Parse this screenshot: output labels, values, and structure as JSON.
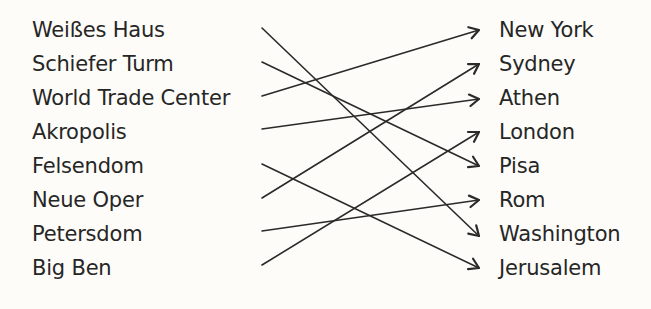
{
  "exercise": {
    "left_items": [
      {
        "label": "Weißes Haus",
        "y": 30
      },
      {
        "label": "Schiefer Turm",
        "y": 64
      },
      {
        "label": "World Trade Center",
        "y": 98
      },
      {
        "label": "Akropolis",
        "y": 132
      },
      {
        "label": "Felsendom",
        "y": 166
      },
      {
        "label": "Neue Oper",
        "y": 200
      },
      {
        "label": "Petersdom",
        "y": 234
      },
      {
        "label": "Big Ben",
        "y": 268
      }
    ],
    "right_items": [
      {
        "label": "New York",
        "y": 30
      },
      {
        "label": "Sydney",
        "y": 64
      },
      {
        "label": "Athen",
        "y": 98
      },
      {
        "label": "London",
        "y": 132
      },
      {
        "label": "Pisa",
        "y": 166
      },
      {
        "label": "Rom",
        "y": 200
      },
      {
        "label": "Washington",
        "y": 234
      },
      {
        "label": "Jerusalem",
        "y": 268
      }
    ],
    "connections": [
      {
        "from": "Weißes Haus",
        "to": "Washington",
        "x1": 262,
        "y1": 28,
        "x2": 479,
        "y2": 236
      },
      {
        "from": "Schiefer Turm",
        "to": "Pisa",
        "x1": 262,
        "y1": 62,
        "x2": 479,
        "y2": 166
      },
      {
        "from": "World Trade Center",
        "to": "New York",
        "x1": 262,
        "y1": 96,
        "x2": 479,
        "y2": 30
      },
      {
        "from": "Akropolis",
        "to": "Athen",
        "x1": 262,
        "y1": 129,
        "x2": 479,
        "y2": 99
      },
      {
        "from": "Felsendom",
        "to": "Jerusalem",
        "x1": 262,
        "y1": 164,
        "x2": 479,
        "y2": 268
      },
      {
        "from": "Neue Oper",
        "to": "Sydney",
        "x1": 262,
        "y1": 198,
        "x2": 479,
        "y2": 64
      },
      {
        "from": "Petersdom",
        "to": "Rom",
        "x1": 262,
        "y1": 231,
        "x2": 479,
        "y2": 200
      },
      {
        "from": "Big Ben",
        "to": "London",
        "x1": 262,
        "y1": 265,
        "x2": 479,
        "y2": 132
      }
    ]
  },
  "colors": {
    "background": "#fdfcf8",
    "text": "#262626",
    "line": "#2a2a2a"
  }
}
